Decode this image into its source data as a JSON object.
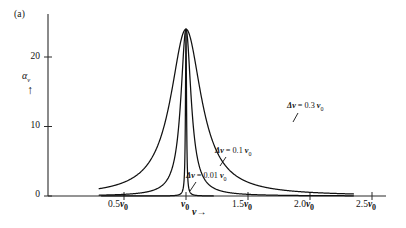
{
  "panel": {
    "label": "(a)"
  },
  "axes": {
    "y": {
      "title": "α",
      "title_sub": "ν",
      "arrow": "↑",
      "ticks": [
        {
          "value": 0,
          "label": "0"
        },
        {
          "value": 10,
          "label": "10"
        },
        {
          "value": 20,
          "label": "20"
        }
      ],
      "range": [
        0,
        27.5
      ]
    },
    "x": {
      "title": "ν",
      "arrow": "→",
      "ticks": [
        {
          "value": 0.5,
          "num": "0.5",
          "unit": "ν",
          "sub": "0"
        },
        {
          "value": 1.0,
          "num": "",
          "unit": "ν",
          "sub": "0"
        },
        {
          "value": 1.5,
          "num": "1.5",
          "unit": "ν",
          "sub": "0"
        },
        {
          "value": 2.0,
          "num": "2.0",
          "unit": "ν",
          "sub": "0"
        },
        {
          "value": 2.5,
          "num": "2.5",
          "unit": "ν",
          "sub": "0"
        }
      ],
      "range": [
        0.12,
        2.56
      ]
    }
  },
  "curve_labels": [
    {
      "name": "delta-nu-0-3",
      "prefix": "Δ",
      "greek": "ν",
      "eq": " = 0.3 ",
      "unit": "ν",
      "sub": "0"
    },
    {
      "name": "delta-nu-0-1",
      "prefix": "Δ",
      "greek": "ν",
      "eq": " = 0.1 ",
      "unit": "ν",
      "sub": "0"
    },
    {
      "name": "delta-nu-0-01",
      "prefix": "Δ",
      "greek": "ν",
      "eq": " = 0.01 ",
      "unit": "ν",
      "sub": "0"
    }
  ],
  "colors": {
    "ink": "#111111",
    "background": "#ffffff",
    "axis": "#2a2a2a"
  },
  "chart_data": {
    "type": "line",
    "title": "",
    "xlabel": "ν →",
    "ylabel": "αν",
    "xlim": [
      0.12,
      2.56
    ],
    "ylim": [
      0,
      27.5
    ],
    "grid": false,
    "legend": "inline-annotations",
    "x_tick_values": [
      0.5,
      1.0,
      1.5,
      2.0,
      2.5
    ],
    "x_tick_labels": [
      "0.5 ν0",
      "ν0",
      "1.5 ν0",
      "2.0 ν0",
      "2.5 ν0"
    ],
    "y_tick_values": [
      0,
      10,
      20
    ],
    "y_tick_labels": [
      "0",
      "10",
      "20"
    ],
    "peak_value": 24,
    "peak_position": 1.0,
    "series": [
      {
        "name": "Δν = 0.01 ν0",
        "linewidth_rel": 0.01,
        "peak": 24,
        "x_start": 0.32,
        "x_end": 1.22,
        "x": [
          0.32,
          0.6,
          0.8,
          0.9,
          0.95,
          0.975,
          0.99,
          1.0,
          1.01,
          1.025,
          1.05,
          1.1,
          1.15,
          1.22
        ],
        "y": [
          0.0,
          0.05,
          0.15,
          0.4,
          1.3,
          4.2,
          14.0,
          24.0,
          14.0,
          4.2,
          1.3,
          0.4,
          0.15,
          0.05
        ]
      },
      {
        "name": "Δν = 0.1 ν0",
        "linewidth_rel": 0.1,
        "peak": 24,
        "x_start": 0.3,
        "x_end": 2.35,
        "x": [
          0.3,
          0.5,
          0.7,
          0.8,
          0.88,
          0.93,
          0.96,
          0.98,
          1.0,
          1.02,
          1.05,
          1.1,
          1.2,
          1.35,
          1.55,
          1.8,
          2.05,
          2.35
        ],
        "y": [
          0.15,
          0.4,
          1.2,
          2.4,
          5.5,
          10.5,
          16.0,
          21.0,
          24.0,
          21.0,
          14.5,
          7.5,
          3.0,
          1.5,
          0.9,
          0.7,
          0.55,
          0.5
        ]
      },
      {
        "name": "Δν = 0.3 ν0",
        "linewidth_rel": 0.3,
        "peak": 24,
        "x_start": 0.3,
        "x_end": 2.35,
        "x": [
          0.3,
          0.45,
          0.6,
          0.72,
          0.82,
          0.9,
          0.97,
          1.03,
          1.08,
          1.15,
          1.25,
          1.4,
          1.55,
          1.7,
          1.85,
          2.0,
          2.15,
          2.35
        ],
        "y": [
          0.4,
          1.0,
          2.4,
          5.0,
          10.5,
          17.5,
          23.0,
          24.0,
          23.2,
          20.5,
          17.0,
          13.5,
          11.2,
          9.7,
          8.5,
          7.6,
          6.9,
          6.1
        ]
      }
    ]
  }
}
